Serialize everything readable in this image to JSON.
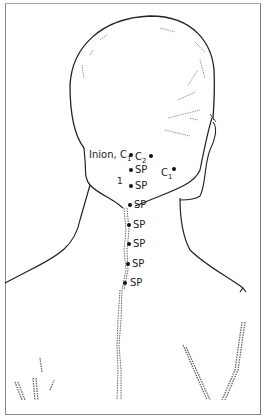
{
  "figure": {
    "landmarks": [
      {
        "id": "inion",
        "label": "Inion, C",
        "sub": "1",
        "x": 131,
        "y": 155,
        "label_side": "left"
      },
      {
        "id": "c2",
        "label": "C",
        "sub": "2",
        "x": 151,
        "y": 156,
        "label_side": "left-of-dot"
      },
      {
        "id": "sp1",
        "label": "SP",
        "x": 131,
        "y": 170
      },
      {
        "id": "c1-right",
        "label": "C",
        "sub": "1",
        "x": 174,
        "y": 170
      },
      {
        "id": "sp2",
        "label": "SP",
        "x": 131,
        "y": 186
      },
      {
        "id": "sp3",
        "label": "SP",
        "x": 130,
        "y": 205
      },
      {
        "id": "sp4",
        "label": "SP",
        "x": 129,
        "y": 225
      },
      {
        "id": "sp5",
        "label": "SP",
        "x": 129,
        "y": 244
      },
      {
        "id": "sp6",
        "label": "SP",
        "x": 128,
        "y": 264
      },
      {
        "id": "sp7",
        "label": "SP",
        "x": 125,
        "y": 283
      }
    ],
    "marker_1": "1",
    "colors": {
      "line": "#222222",
      "hatch": "#666666",
      "dot": "#111111"
    }
  }
}
